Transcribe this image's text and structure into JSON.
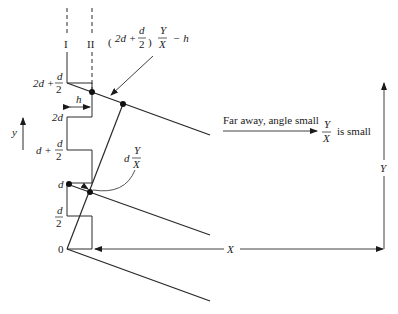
{
  "diagram": {
    "columns": {
      "left_label": "I",
      "right_label": "II"
    },
    "height_labels": {
      "top": {
        "main": "2d +",
        "frac_num": "d",
        "frac_den": "2"
      },
      "two_d": "2d",
      "d_plus_half": {
        "main": "d +",
        "frac_num": "d",
        "frac_den": "2"
      },
      "d": "d",
      "half_d": {
        "frac_num": "d",
        "frac_den": "2"
      },
      "zero": "0"
    },
    "h_label": "h",
    "y_axis_label": "y",
    "annotation_top": {
      "open": "(",
      "expr": "2d +",
      "frac_num": "d",
      "frac_den": "2",
      "close": ")",
      "ratio_num": "Y",
      "ratio_den": "X",
      "suffix": "− h"
    },
    "annotation_mid": {
      "prefix": "d",
      "ratio_num": "Y",
      "ratio_den": "X"
    },
    "far_away": {
      "text": "Far away, angle small",
      "ratio_num": "Y",
      "ratio_den": "X",
      "suffix": "is small"
    },
    "distance_labels": {
      "X": "X",
      "Y": "Y"
    }
  }
}
